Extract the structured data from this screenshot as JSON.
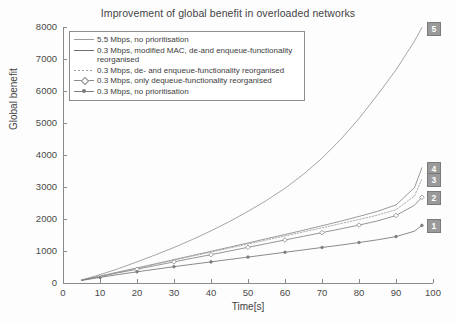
{
  "chart_data": {
    "type": "line",
    "title": "Improvement of global benefit in overloaded networks",
    "xlabel": "Time[s]",
    "ylabel": "Global benefit",
    "xlim": [
      0,
      100
    ],
    "ylim": [
      0,
      8000
    ],
    "xticks": [
      0,
      10,
      20,
      30,
      40,
      50,
      60,
      70,
      80,
      90,
      100
    ],
    "yticks": [
      0,
      1000,
      2000,
      3000,
      4000,
      5000,
      6000,
      7000,
      8000
    ],
    "grid": false,
    "legend_position": "upper-left-inside",
    "x": [
      5,
      10,
      15,
      20,
      25,
      30,
      35,
      40,
      45,
      50,
      55,
      60,
      65,
      70,
      75,
      80,
      85,
      90,
      95,
      97
    ],
    "series": [
      {
        "name": "5.5 Mbps, no prioritisation",
        "tag": "5",
        "marker": "none",
        "linestyle": "solid",
        "color": "#9b9b9b",
        "values": [
          95,
          260,
          450,
          660,
          880,
          1110,
          1360,
          1630,
          1920,
          2240,
          2580,
          2960,
          3400,
          3900,
          4480,
          5140,
          5880,
          6660,
          7560,
          7980
        ]
      },
      {
        "name": "0.3 Mbps, modified MAC, de-and enqueue-functionality reorganised",
        "tag": "4",
        "marker": "none",
        "linestyle": "solid",
        "color": "#8f8f8f",
        "values": [
          90,
          215,
          345,
          470,
          600,
          730,
          860,
          990,
          1120,
          1250,
          1385,
          1515,
          1650,
          1790,
          1930,
          2080,
          2240,
          2440,
          2980,
          3600
        ]
      },
      {
        "name": "0.3 Mbps, de- and enqueue-functionality reorganised",
        "tag": "3",
        "marker": "none",
        "linestyle": "dotted",
        "color": "#a5a5a5",
        "values": [
          88,
          210,
          338,
          462,
          588,
          714,
          840,
          965,
          1092,
          1218,
          1345,
          1470,
          1598,
          1725,
          1855,
          1985,
          2120,
          2290,
          2720,
          3250
        ]
      },
      {
        "name": "0.3 Mbps, only dequeue-functionality reorganised",
        "tag": "2",
        "marker": "diamond",
        "linestyle": "solid",
        "color": "#8a8a8a",
        "values": [
          85,
          200,
          320,
          430,
          545,
          660,
          775,
          885,
          1000,
          1115,
          1230,
          1345,
          1460,
          1575,
          1690,
          1810,
          1940,
          2110,
          2430,
          2680
        ]
      },
      {
        "name": "0.3 Mbps, no prioritisation",
        "tag": "1",
        "marker": "dot",
        "linestyle": "solid",
        "color": "#7d7d7d",
        "values": [
          80,
          175,
          265,
          350,
          430,
          510,
          585,
          660,
          735,
          810,
          885,
          960,
          1035,
          1110,
          1185,
          1265,
          1350,
          1450,
          1620,
          1800
        ]
      }
    ]
  },
  "legend": {
    "items": [
      {
        "label": "5.5 Mbps, no prioritisation"
      },
      {
        "label": "0.3 Mbps, modified MAC, de-and enqueue-functionality reorganised"
      },
      {
        "label": "0.3 Mbps, de- and enqueue-functionality reorganised"
      },
      {
        "label": "0.3 Mbps, only dequeue-functionality reorganised"
      },
      {
        "label": "0.3 Mbps, no prioritisation"
      }
    ]
  },
  "tags": {
    "t5": "5",
    "t4": "4",
    "t3": "3",
    "t2": "2",
    "t1": "1"
  }
}
